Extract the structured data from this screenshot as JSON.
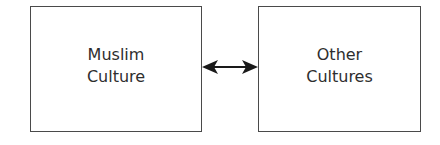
{
  "diagram": {
    "nodes": [
      {
        "id": "muslim",
        "line1": "Muslim",
        "line2": "Culture"
      },
      {
        "id": "other",
        "line1": "Other",
        "line2": "Cultures"
      }
    ],
    "edges": [
      {
        "from": "muslim",
        "to": "other",
        "type": "bidirectional-arrow"
      }
    ],
    "colors": {
      "border": "#4a4a4a",
      "text": "#2e2e2e",
      "arrow": "#1a1a1a"
    }
  }
}
